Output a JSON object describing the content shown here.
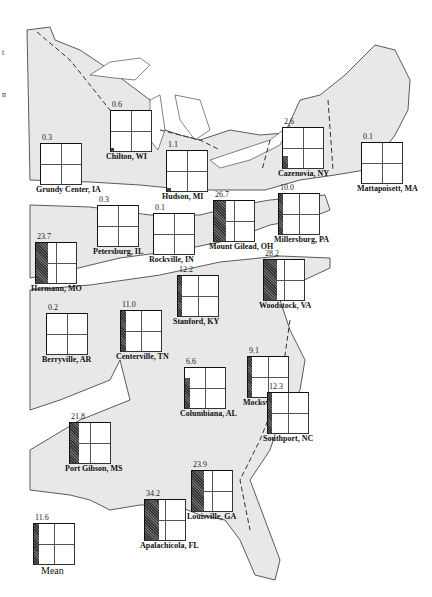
{
  "map": {
    "region": "Eastern United States",
    "land_color": "#e8e8e8",
    "outline_color": "#333333",
    "bar_color": "#555555",
    "margin_marks": [
      {
        "text": "t",
        "y": 48
      },
      {
        "text": "n",
        "y": 90
      }
    ]
  },
  "sites": [
    {
      "id": "grundy-center",
      "label": "Grundy Center, IA",
      "value": "0.3",
      "x": 40,
      "y": 143,
      "bar_w": 0,
      "bar_h": 0
    },
    {
      "id": "chilton",
      "label": "Chilton, WI",
      "value": "0.6",
      "x": 110,
      "y": 110,
      "bar_w": 3,
      "bar_h": 3
    },
    {
      "id": "hudson",
      "label": "Hudson, MI",
      "value": "1.1",
      "x": 166,
      "y": 150,
      "bar_w": 4,
      "bar_h": 3
    },
    {
      "id": "cazenovia",
      "label": "Cazenovia, NY",
      "value": "2.6",
      "x": 282,
      "y": 127,
      "bar_w": 5,
      "bar_h": 12
    },
    {
      "id": "mattapoisett",
      "label": "Mattapoisett, MA",
      "value": "0.1",
      "x": 361,
      "y": 142,
      "bar_w": 0,
      "bar_h": 0
    },
    {
      "id": "petersburg",
      "label": "Petersburg, IL",
      "value": "0.3",
      "x": 97,
      "y": 205,
      "bar_w": 0,
      "bar_h": 0
    },
    {
      "id": "rockville",
      "label": "Rockville, IN",
      "value": "0.1",
      "x": 153,
      "y": 213,
      "bar_w": 0,
      "bar_h": 0
    },
    {
      "id": "mount-gilead",
      "label": "Mount Gilead, OH",
      "value": "26.7",
      "x": 213,
      "y": 200,
      "bar_w": 12,
      "bar_h": 40
    },
    {
      "id": "millersburg",
      "label": "Millersburg, PA",
      "value": "10.0",
      "x": 278,
      "y": 193,
      "bar_w": 4,
      "bar_h": 40
    },
    {
      "id": "hermann",
      "label": "Hermann, MO",
      "value": "23.7",
      "x": 35,
      "y": 242,
      "bar_w": 12,
      "bar_h": 40
    },
    {
      "id": "stanford",
      "label": "Stanford, KY",
      "value": "12.2",
      "x": 177,
      "y": 275,
      "bar_w": 4,
      "bar_h": 40
    },
    {
      "id": "woodstock",
      "label": "Woodstock, VA",
      "value": "28.2",
      "x": 263,
      "y": 259,
      "bar_w": 13,
      "bar_h": 40
    },
    {
      "id": "berryville",
      "label": "Berryville, AR",
      "value": "0.2",
      "x": 46,
      "y": 313,
      "bar_w": 0,
      "bar_h": 0
    },
    {
      "id": "centerville",
      "label": "Centerville, TN",
      "value": "11.0",
      "x": 120,
      "y": 310,
      "bar_w": 5,
      "bar_h": 40
    },
    {
      "id": "columbiana",
      "label": "Columbiana, AL",
      "value": "6.6",
      "x": 184,
      "y": 367,
      "bar_w": 5,
      "bar_h": 30
    },
    {
      "id": "mocksville",
      "label": "Mocksville, NC",
      "value": "9.1",
      "x": 247,
      "y": 356,
      "bar_w": 4,
      "bar_h": 40
    },
    {
      "id": "louisville",
      "label": "Louisville, GA",
      "value": "23.9",
      "x": 191,
      "y": 470,
      "bar_w": 12,
      "bar_h": 40
    },
    {
      "id": "southport",
      "label": "Southport, NC",
      "value": "12.3",
      "x": 267,
      "y": 392,
      "bar_w": 4,
      "bar_h": 40
    },
    {
      "id": "port-gibson",
      "label": "Port Gibson, MS",
      "value": "21.8",
      "x": 69,
      "y": 422,
      "bar_w": 9,
      "bar_h": 40
    },
    {
      "id": "apalachicola",
      "label": "Apalachicola, FL",
      "value": "34.2",
      "x": 144,
      "y": 499,
      "bar_w": 14,
      "bar_h": 40
    },
    {
      "id": "mean",
      "label": "Mean",
      "value": "11.6",
      "x": 33,
      "y": 523,
      "bar_w": 5,
      "bar_h": 40,
      "is_mean": true
    }
  ]
}
